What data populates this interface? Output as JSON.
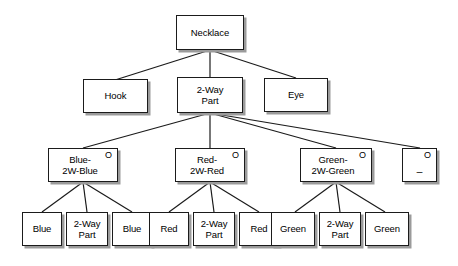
{
  "diagram": {
    "type": "tree",
    "background_color": "#ffffff",
    "node_fill": "#ffffff",
    "node_border_color": "#1b1b1b",
    "node_shadow_color": "#9b9b9b",
    "edge_color": "#1b1b1b",
    "optional_marker": "O"
  },
  "nodes": {
    "root": {
      "label": "Necklace",
      "optional": false
    },
    "level2": [
      {
        "id": "hook",
        "label": "Hook",
        "optional": false
      },
      {
        "id": "twoway",
        "label": "2-Way\nPart",
        "optional": false
      },
      {
        "id": "eye",
        "label": "Eye",
        "optional": false
      }
    ],
    "level3": [
      {
        "id": "blue2wblue",
        "label": "Blue-\n2W-Blue",
        "optional": true,
        "marker": "O"
      },
      {
        "id": "red2wred",
        "label": "Red-\n2W-Red",
        "optional": true,
        "marker": "O"
      },
      {
        "id": "green2wgreen",
        "label": "Green-\n2W-Green",
        "optional": true,
        "marker": "O"
      },
      {
        "id": "placeholder",
        "label": "_",
        "optional": true,
        "marker": "O"
      }
    ],
    "level4": [
      {
        "id": "blue-left",
        "label": "Blue",
        "optional": false
      },
      {
        "id": "twoway-blue",
        "label": "2-Way\nPart",
        "optional": false
      },
      {
        "id": "blue-right",
        "label": "Blue",
        "optional": false
      },
      {
        "id": "red-left",
        "label": "Red",
        "optional": false
      },
      {
        "id": "twoway-red",
        "label": "2-Way\nPart",
        "optional": false
      },
      {
        "id": "red-right",
        "label": "Red",
        "optional": false
      },
      {
        "id": "green-left",
        "label": "Green",
        "optional": false
      },
      {
        "id": "twoway-green",
        "label": "2-Way\nPart",
        "optional": false
      },
      {
        "id": "green-right",
        "label": "Green",
        "optional": false
      }
    ]
  }
}
